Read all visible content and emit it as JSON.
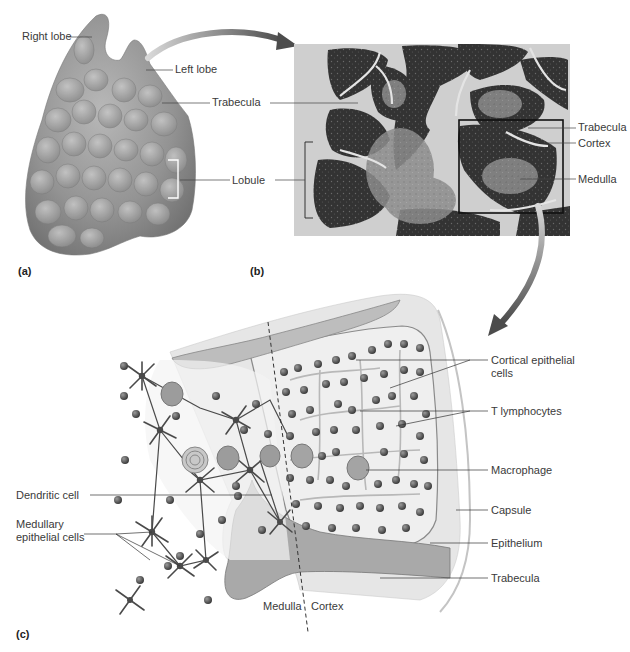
{
  "figure": {
    "panels": [
      {
        "id": "a",
        "letter": "(a)",
        "labels": {
          "right_lobe": "Right lobe",
          "left_lobe": "Left lobe",
          "trabecula": "Trabecula",
          "lobule": "Lobule"
        }
      },
      {
        "id": "b",
        "letter": "(b)",
        "labels": {
          "trabecula": "Trabecula",
          "cortex": "Cortex",
          "medulla": "Medulla"
        }
      },
      {
        "id": "c",
        "letter": "(c)",
        "labels": {
          "cortical_epithelial_cells": "Cortical epithelial cells",
          "t_lymphocytes": "T lymphocytes",
          "macrophage": "Macrophage",
          "capsule": "Capsule",
          "epithelium": "Epithelium",
          "trabecula": "Trabecula",
          "dendritic_cell": "Dendritic cell",
          "medullary_epithelial_cells": "Medullary epithelial cells",
          "medulla": "Medulla",
          "cortex": "Cortex"
        }
      }
    ]
  },
  "colors": {
    "background": "#ffffff",
    "organ_fill": "#9a9a9a",
    "micrograph_dark": "#2e2e2e",
    "micrograph_light": "#8a8a8a",
    "arrow": "#6a6a6a",
    "text": "#3a3a3a",
    "leader_line": "#444444",
    "lymphocyte": "#5a5a5a",
    "epithelial_cell": "#4a4a4a",
    "capsule": "#bdbdbd"
  }
}
